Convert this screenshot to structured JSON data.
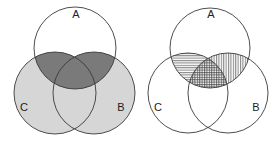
{
  "colors": {
    "background": "#ffffff",
    "outline": "#3a3a3a",
    "light_fill": "#d6d6d6",
    "dark_fill": "#7a7a7a",
    "hatch": "#333333",
    "label": "#222222"
  },
  "diagrams": [
    {
      "id": "left",
      "description": "Three-set Venn diagram: B and C shaded light grey, intersections with A shaded dark grey",
      "sets": [
        {
          "label": "A",
          "cx": 75,
          "cy": 48,
          "r": 41,
          "label_x": 76,
          "label_y": 15
        },
        {
          "label": "C",
          "cx": 55,
          "cy": 93,
          "r": 41,
          "label_x": 24,
          "label_y": 108
        },
        {
          "label": "B",
          "cx": 94,
          "cy": 93,
          "r": 41,
          "label_x": 121,
          "label_y": 108
        }
      ],
      "shading": {
        "B_or_C": "light",
        "A_and_B": "dark",
        "A_and_C": "dark",
        "A_and_B_and_C": "dark"
      }
    },
    {
      "id": "right",
      "description": "Three-set Venn diagram with hatched intersections: A∩C horizontal lines, A∩B vertical lines, A∩B∩C crosshatch",
      "sets": [
        {
          "label": "A",
          "cx": 210,
          "cy": 48,
          "r": 40,
          "label_x": 211,
          "label_y": 15
        },
        {
          "label": "C",
          "cx": 188,
          "cy": 93,
          "r": 40,
          "label_x": 158,
          "label_y": 108
        },
        {
          "label": "B",
          "cx": 228,
          "cy": 93,
          "r": 40,
          "label_x": 256,
          "label_y": 108
        }
      ],
      "shading": {
        "A_and_C": "horizontal-hatch",
        "A_and_B": "vertical-hatch",
        "A_and_B_and_C": "cross-hatch"
      }
    }
  ],
  "labels": {
    "left_a": "A",
    "left_b": "B",
    "left_c": "C",
    "right_a": "A",
    "right_b": "B",
    "right_c": "C"
  }
}
